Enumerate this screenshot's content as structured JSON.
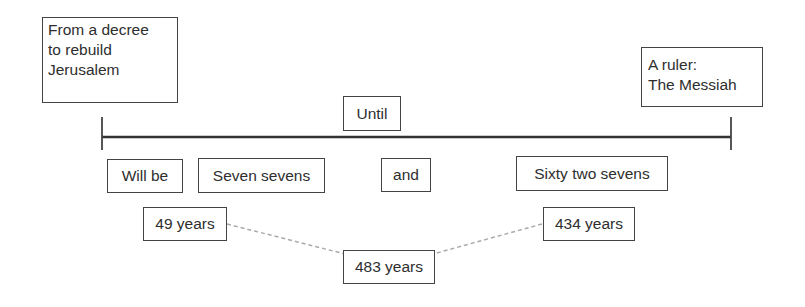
{
  "diagram": {
    "start_label": {
      "lines": [
        "From a decree",
        "to rebuild",
        "Jerusalem"
      ]
    },
    "end_label": {
      "lines": [
        "A ruler:",
        "The Messiah"
      ]
    },
    "timeline_label": "Until",
    "segments": {
      "will_be": "Will be",
      "seven_sevens": "Seven sevens",
      "and": "and",
      "sixty_two_sevens": "Sixty two sevens"
    },
    "years": {
      "first": "49 years",
      "second": "434 years",
      "total": "483 years"
    },
    "colors": {
      "line": "#333333",
      "border": "#444444",
      "dashed_connector": "#aaaaaa"
    }
  }
}
